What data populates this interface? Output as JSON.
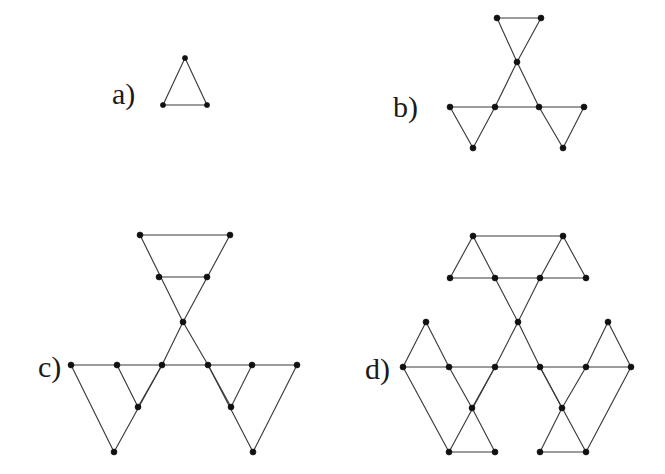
{
  "figure": {
    "background_color": "#ffffff",
    "edge_color": "#3b3b3b",
    "node_color": "#111111",
    "label_color": "#1a1a1a",
    "width": 665,
    "height": 474
  },
  "panels": [
    {
      "id": "a",
      "label": "a)",
      "label_x": 112,
      "label_y": 104,
      "node_radius": 2.6,
      "nodes": [
        [
          185,
          58
        ],
        [
          163,
          105
        ],
        [
          207,
          105
        ]
      ],
      "edges": [
        [
          185,
          58,
          163,
          105
        ],
        [
          185,
          58,
          207,
          105
        ],
        [
          163,
          105,
          207,
          105
        ]
      ]
    },
    {
      "id": "b",
      "label": "b)",
      "label_x": 393,
      "label_y": 117,
      "node_radius": 3.0,
      "nodes": [
        [
          497,
          18
        ],
        [
          541,
          18
        ],
        [
          517,
          62
        ],
        [
          450,
          107
        ],
        [
          495,
          107
        ],
        [
          539,
          107
        ],
        [
          584,
          107
        ],
        [
          473,
          148
        ],
        [
          563,
          148
        ]
      ],
      "edges": [
        [
          497,
          18,
          541,
          18
        ],
        [
          497,
          18,
          517,
          62
        ],
        [
          541,
          18,
          517,
          62
        ],
        [
          517,
          62,
          495,
          107
        ],
        [
          517,
          62,
          539,
          107
        ],
        [
          450,
          107,
          584,
          107
        ],
        [
          450,
          107,
          473,
          148
        ],
        [
          495,
          107,
          473,
          148
        ],
        [
          539,
          107,
          563,
          148
        ],
        [
          584,
          107,
          563,
          148
        ]
      ]
    },
    {
      "id": "c",
      "label": "c)",
      "label_x": 38,
      "label_y": 377,
      "node_radius": 3.0,
      "nodes": [
        [
          140,
          235
        ],
        [
          230,
          235
        ],
        [
          159,
          277
        ],
        [
          207,
          277
        ],
        [
          183,
          322
        ],
        [
          71,
          365
        ],
        [
          117,
          365
        ],
        [
          162,
          365
        ],
        [
          208,
          365
        ],
        [
          252,
          365
        ],
        [
          297,
          365
        ],
        [
          138,
          407
        ],
        [
          231,
          407
        ],
        [
          114,
          452
        ],
        [
          253,
          452
        ]
      ],
      "edges": [
        [
          140,
          235,
          230,
          235
        ],
        [
          140,
          235,
          183,
          322
        ],
        [
          230,
          235,
          183,
          322
        ],
        [
          159,
          277,
          207,
          277
        ],
        [
          183,
          322,
          162,
          365
        ],
        [
          183,
          322,
          208,
          365
        ],
        [
          71,
          365,
          297,
          365
        ],
        [
          71,
          365,
          114,
          452
        ],
        [
          162,
          365,
          114,
          452
        ],
        [
          117,
          365,
          138,
          407
        ],
        [
          162,
          365,
          138,
          407
        ],
        [
          208,
          365,
          253,
          452
        ],
        [
          297,
          365,
          253,
          452
        ],
        [
          208,
          365,
          231,
          407
        ],
        [
          252,
          365,
          231,
          407
        ]
      ]
    },
    {
      "id": "d",
      "label": "d)",
      "label_x": 365,
      "label_y": 379,
      "node_radius": 3.0,
      "nodes": [
        [
          473,
          236
        ],
        [
          563,
          236
        ],
        [
          450,
          278
        ],
        [
          495,
          278
        ],
        [
          540,
          278
        ],
        [
          586,
          278
        ],
        [
          518,
          322
        ],
        [
          426,
          322
        ],
        [
          608,
          322
        ],
        [
          403,
          367
        ],
        [
          449,
          367
        ],
        [
          495,
          367
        ],
        [
          540,
          367
        ],
        [
          586,
          367
        ],
        [
          631,
          367
        ],
        [
          472,
          408
        ],
        [
          562,
          408
        ],
        [
          449,
          452
        ],
        [
          495,
          452
        ],
        [
          540,
          452
        ],
        [
          586,
          452
        ]
      ],
      "edges": [
        [
          473,
          236,
          563,
          236
        ],
        [
          473,
          236,
          450,
          278
        ],
        [
          473,
          236,
          495,
          278
        ],
        [
          563,
          236,
          540,
          278
        ],
        [
          563,
          236,
          586,
          278
        ],
        [
          450,
          278,
          586,
          278
        ],
        [
          495,
          278,
          518,
          322
        ],
        [
          540,
          278,
          518,
          322
        ],
        [
          518,
          322,
          495,
          367
        ],
        [
          518,
          322,
          540,
          367
        ],
        [
          426,
          322,
          403,
          367
        ],
        [
          426,
          322,
          449,
          367
        ],
        [
          608,
          322,
          586,
          367
        ],
        [
          608,
          322,
          631,
          367
        ],
        [
          403,
          367,
          631,
          367
        ],
        [
          403,
          367,
          449,
          452
        ],
        [
          495,
          367,
          449,
          452
        ],
        [
          449,
          367,
          472,
          408
        ],
        [
          495,
          367,
          472,
          408
        ],
        [
          472,
          408,
          495,
          452
        ],
        [
          449,
          452,
          495,
          452
        ],
        [
          540,
          367,
          586,
          452
        ],
        [
          631,
          367,
          586,
          452
        ],
        [
          540,
          367,
          562,
          408
        ],
        [
          586,
          367,
          562,
          408
        ],
        [
          562,
          408,
          540,
          452
        ],
        [
          540,
          452,
          586,
          452
        ]
      ]
    }
  ]
}
